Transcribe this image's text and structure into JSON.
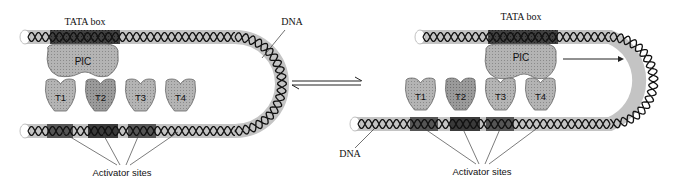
{
  "left_panel": {
    "tata_label": "TATA box",
    "dna_label": "DNA",
    "pic_label": "PIC",
    "activators": [
      "T1",
      "T2",
      "T3",
      "T4"
    ],
    "sites_label": "Activator sites"
  },
  "right_panel": {
    "tata_label": "TATA box",
    "dna_label": "DNA",
    "pic_label": "PIC",
    "activators": [
      "T1",
      "T2",
      "T3",
      "T4"
    ],
    "sites_label": "Activator sites"
  },
  "colors": {
    "tube": "#c8c8c8",
    "dark_region": "#3a3a3a",
    "protein": "#a8a8a8",
    "protein_dark": "#8c8c8c",
    "helix": "#111111"
  }
}
